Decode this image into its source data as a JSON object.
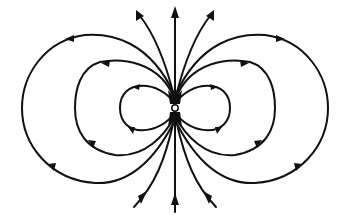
{
  "diagram": {
    "title": "Magnetic dipole field lines",
    "colors": {
      "line": "#111111",
      "background": "#ffffff"
    },
    "center": {
      "x": 175,
      "y": 108
    },
    "loops": [
      {
        "name": "inner",
        "left_extent": 120,
        "right_extent": 230,
        "top": 83,
        "bottom": 133
      },
      {
        "name": "middle",
        "left_extent": 75,
        "right_extent": 275,
        "top": 60,
        "bottom": 155
      },
      {
        "name": "outer",
        "left_extent": 22,
        "right_extent": 328,
        "top": 33,
        "bottom": 183
      }
    ],
    "open_lines": {
      "top_count": 3,
      "bottom_count": 3,
      "direction": "out-top, in-bottom"
    }
  }
}
